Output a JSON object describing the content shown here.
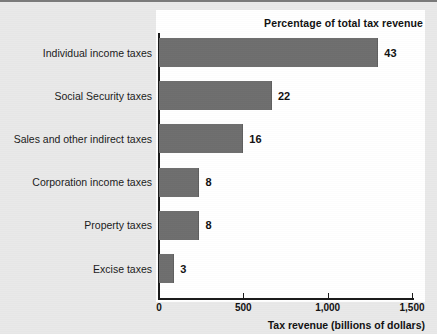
{
  "chart_data": {
    "type": "bar",
    "orientation": "horizontal",
    "title": "",
    "header_note": "Percentage of total tax revenue",
    "xlabel": "Tax revenue (billions of dollars)",
    "ylabel": "",
    "xlim": [
      0,
      1500
    ],
    "xticks": [
      0,
      500,
      1000,
      1500
    ],
    "xtick_labels": [
      "0",
      "500",
      "1,000",
      "1,500"
    ],
    "grid": false,
    "legend": null,
    "bar_color": "#6e6e6e",
    "panel_color": "#ffffff",
    "background_color": "#e9e9e9",
    "categories": [
      "Individual income taxes",
      "Social Security taxes",
      "Sales and other indirect taxes",
      "Corporation income taxes",
      "Property taxes",
      "Excise taxes"
    ],
    "values": [
      1300,
      670,
      500,
      240,
      240,
      90
    ],
    "data_labels": [
      "43",
      "22",
      "16",
      "8",
      "8",
      "3"
    ],
    "data_label_units": "percent of total tax revenue"
  }
}
